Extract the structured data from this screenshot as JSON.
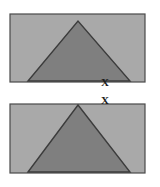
{
  "figure": {
    "background_color": "#ffffff",
    "width": 160,
    "height": 187
  },
  "palette": {
    "page_background": "#ffffff",
    "panel_fill": "#a9a9a9",
    "panel_border": "#4a4a4a",
    "triangle_fill": "#7f7f7f",
    "triangle_outline": "#3c3c3c",
    "mark_color": "#1c1c1c"
  },
  "panels": [
    {
      "id": "panel-top",
      "label": "top-panel",
      "x": 10,
      "y": 14,
      "width": 135,
      "height": 68,
      "fill": "#a9a9a9",
      "border": "#4a4a4a",
      "triangle": {
        "label": "top-panel-triangle",
        "apex_x": 78,
        "apex_y": 21,
        "base_left_x": 28,
        "base_right_x": 130,
        "base_y": 81,
        "fill": "#7f7f7f",
        "outline": "#3c3c3c"
      }
    },
    {
      "id": "panel-bottom",
      "label": "bottom-panel",
      "x": 10,
      "y": 104,
      "width": 135,
      "height": 69,
      "fill": "#a9a9a9",
      "border": "#4a4a4a",
      "triangle": {
        "label": "bottom-panel-triangle",
        "apex_x": 78,
        "apex_y": 105,
        "base_left_x": 28,
        "base_right_x": 130,
        "base_y": 172,
        "fill": "#7f7f7f",
        "outline": "#3c3c3c"
      }
    }
  ],
  "marks": [
    {
      "id": "mark-upper",
      "label": "X",
      "x": 105,
      "y": 83,
      "font_size": 11,
      "color": "#1c1c1c"
    },
    {
      "id": "mark-lower",
      "label": "X",
      "x": 105,
      "y": 101,
      "font_size": 11,
      "color": "#1c1c1c"
    }
  ]
}
